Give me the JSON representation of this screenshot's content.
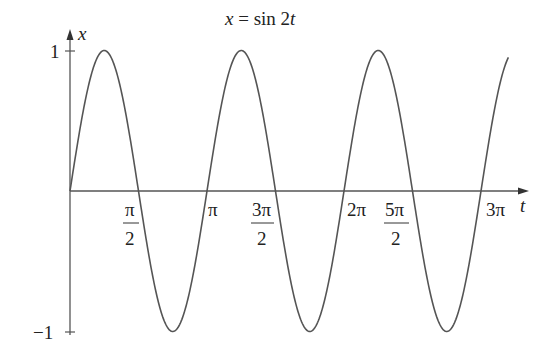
{
  "chart_data": {
    "type": "line",
    "title": "x = sin 2t",
    "title_parts": {
      "lhs": "x",
      "eq": " = sin 2",
      "var": "t"
    },
    "xlabel": "t",
    "ylabel": "x",
    "function": "x = sin(2t)",
    "xlim": [
      0,
      3.2
    ],
    "xlim_units": "multiples of pi",
    "ylim": [
      -1,
      1
    ],
    "grid": false,
    "legend": null,
    "x_ticks": [
      {
        "value": 0.5,
        "label": "π/2",
        "num": "π",
        "den": "2"
      },
      {
        "value": 1.0,
        "label": "π"
      },
      {
        "value": 1.5,
        "label": "3π/2",
        "num": "3π",
        "den": "2"
      },
      {
        "value": 2.0,
        "label": "2π"
      },
      {
        "value": 2.5,
        "label": "5π/2",
        "num": "5π",
        "den": "2"
      },
      {
        "value": 3.0,
        "label": "3π"
      }
    ],
    "y_ticks": [
      {
        "value": 1,
        "label": "1"
      },
      {
        "value": -1,
        "label": "−1"
      }
    ],
    "series": [
      {
        "name": "sin 2t",
        "color": "#555555",
        "x_pi": [
          0,
          0.25,
          0.5,
          0.75,
          1.0,
          1.25,
          1.5,
          1.75,
          2.0,
          2.25,
          2.5,
          2.75,
          3.0,
          3.2
        ],
        "values": [
          0,
          1,
          0,
          -1,
          0,
          1,
          0,
          -1,
          0,
          1,
          0,
          -1,
          0,
          0.95
        ]
      }
    ]
  }
}
